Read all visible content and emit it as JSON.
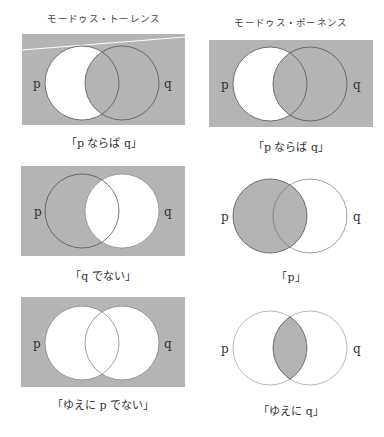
{
  "colors": {
    "shade": "#b4b4b4",
    "outline": "#555555",
    "background": "#ffffff",
    "highlight_line": "#ffffff"
  },
  "columns": [
    {
      "heading": "モードゥス・トーレンス"
    },
    {
      "heading": "モードゥス・ポーネンス"
    }
  ],
  "panels": [
    {
      "id": "tollens-premise-1",
      "column": 0,
      "row": 0,
      "caption": "「p ならば q」",
      "left_label": "p",
      "right_label": "q",
      "background_shaded": true,
      "shaded_regions": [
        "outside",
        "q_only",
        "p_and_q"
      ],
      "unshaded_regions": [
        "p_only"
      ]
    },
    {
      "id": "ponens-premise-1",
      "column": 1,
      "row": 0,
      "caption": "「p ならば q」",
      "left_label": "p",
      "right_label": "q",
      "background_shaded": true,
      "shaded_regions": [
        "outside",
        "q_only",
        "p_and_q"
      ],
      "unshaded_regions": [
        "p_only"
      ]
    },
    {
      "id": "tollens-premise-2",
      "column": 0,
      "row": 1,
      "caption": "「q でない」",
      "left_label": "p",
      "right_label": "q",
      "background_shaded": true,
      "shaded_regions": [
        "outside",
        "p_only"
      ],
      "unshaded_regions": [
        "q_only",
        "p_and_q"
      ]
    },
    {
      "id": "ponens-premise-2",
      "column": 1,
      "row": 1,
      "caption": "「p」",
      "left_label": "p",
      "right_label": "q",
      "background_shaded": false,
      "shaded_regions": [
        "p_only",
        "p_and_q"
      ],
      "unshaded_regions": [
        "q_only",
        "outside"
      ]
    },
    {
      "id": "tollens-conclusion",
      "column": 0,
      "row": 2,
      "caption": "「ゆえに p でない」",
      "left_label": "p",
      "right_label": "q",
      "background_shaded": true,
      "shaded_regions": [
        "outside"
      ],
      "unshaded_regions": [
        "p_only",
        "q_only",
        "p_and_q"
      ]
    },
    {
      "id": "ponens-conclusion",
      "column": 1,
      "row": 2,
      "caption": "「ゆえに q」",
      "left_label": "p",
      "right_label": "q",
      "background_shaded": false,
      "shaded_regions": [
        "p_and_q"
      ],
      "unshaded_regions": [
        "p_only",
        "q_only",
        "outside"
      ]
    }
  ]
}
